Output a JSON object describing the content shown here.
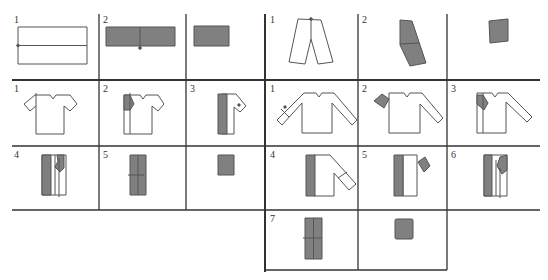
{
  "colors": {
    "line": "#333333",
    "fill": "#808080",
    "stroke": "#555555",
    "bg": "#ffffff"
  },
  "sections": {
    "towel": {
      "steps": [
        "1",
        "2",
        ""
      ]
    },
    "pants": {
      "steps": [
        "1",
        "2",
        ""
      ]
    },
    "tshirt": {
      "steps": [
        "1",
        "2",
        "3",
        "4",
        "5",
        ""
      ]
    },
    "longsleeve": {
      "steps": [
        "1",
        "2",
        "3",
        "4",
        "5",
        "6",
        "7",
        ""
      ]
    }
  }
}
